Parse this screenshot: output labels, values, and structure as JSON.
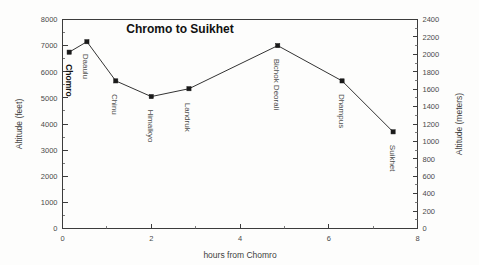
{
  "chart_data": {
    "type": "line",
    "title": "Chromo to Suikhet",
    "xlabel": "hours from Chomro",
    "ylabel": "Altitude (feet)",
    "ylabel_secondary": "Altitude (meters)",
    "xlim": [
      0,
      8
    ],
    "ylim": [
      0,
      8000
    ],
    "ylim_secondary": [
      0,
      2400
    ],
    "grid": false,
    "legend": "none",
    "x_ticks": [
      0,
      2,
      4,
      6,
      8
    ],
    "x_minor_ticks": [
      1,
      3,
      5,
      7
    ],
    "y_ticks": [
      0,
      1000,
      2000,
      3000,
      4000,
      5000,
      6000,
      7000,
      8000
    ],
    "y_ticks_secondary": [
      0,
      200,
      400,
      600,
      800,
      1000,
      1200,
      1400,
      1600,
      1800,
      2000,
      2200,
      2400
    ],
    "x": [
      0.15,
      0.55,
      1.2,
      2.0,
      2.85,
      4.85,
      6.3,
      7.45
    ],
    "values": [
      6750,
      7150,
      5650,
      5050,
      5350,
      7000,
      5650,
      3700
    ],
    "point_labels": [
      "Chomro",
      "Daaulu",
      "Chinu",
      "Himalkyo",
      "Landruk",
      "Bichok Deorali",
      "Dhampus",
      "Suikhet"
    ],
    "points": [
      {
        "label": "Chomro",
        "x": 0.15,
        "y": 6750,
        "emphasis": true
      },
      {
        "label": "Daaulu",
        "x": 0.55,
        "y": 7150,
        "emphasis": false
      },
      {
        "label": "Chinu",
        "x": 1.2,
        "y": 5650,
        "emphasis": false
      },
      {
        "label": "Himalkyo",
        "x": 2.0,
        "y": 5050,
        "emphasis": false
      },
      {
        "label": "Landruk",
        "x": 2.85,
        "y": 5350,
        "emphasis": false
      },
      {
        "label": "Bichok Deorali",
        "x": 4.85,
        "y": 7000,
        "emphasis": false
      },
      {
        "label": "Dhampus",
        "x": 6.3,
        "y": 5650,
        "emphasis": false
      },
      {
        "label": "Suikhet",
        "x": 7.45,
        "y": 3700,
        "emphasis": false
      }
    ],
    "series": [
      {
        "name": "altitude-profile",
        "marker": "filled-square",
        "color": "#1a1a1a",
        "values": [
          6750,
          7150,
          5650,
          5050,
          5350,
          7000,
          5650,
          3700
        ]
      }
    ]
  },
  "figure": {
    "background": "#fdfdfc",
    "axis_color": "#3c3c3c",
    "line_color": "#333333",
    "marker_color": "#1a1a1a",
    "title_color": "#111111"
  }
}
